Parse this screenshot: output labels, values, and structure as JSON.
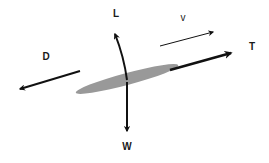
{
  "diagram": {
    "title": "",
    "type": "free-body diagram",
    "colors": {
      "arrow": "#111111",
      "body": "#999999",
      "background": "#ffffff"
    },
    "body": {
      "shape": "ellipse",
      "cx": 127,
      "cy": 79,
      "rx": 53,
      "ry": 6,
      "rotate": -15
    },
    "forces": [
      {
        "id": "lift",
        "label": "L",
        "label_x": 116,
        "label_y": 14,
        "x1": 127,
        "y1": 80,
        "x2": 115,
        "y2": 34,
        "curved": true,
        "width": 2
      },
      {
        "id": "weight",
        "label": "W",
        "label_x": 127,
        "label_y": 147,
        "x1": 127,
        "y1": 82,
        "x2": 127,
        "y2": 131,
        "curved": false,
        "width": 2
      },
      {
        "id": "thrust",
        "label": "T",
        "label_x": 252,
        "label_y": 47,
        "x1": 170,
        "y1": 70,
        "x2": 231,
        "y2": 53,
        "curved": false,
        "width": 2.6
      },
      {
        "id": "drag",
        "label": "D",
        "label_x": 46,
        "label_y": 57,
        "x1": 80,
        "y1": 71,
        "x2": 20,
        "y2": 89,
        "curved": false,
        "width": 2
      },
      {
        "id": "velocity",
        "label": "v",
        "label_x": 183,
        "label_y": 18,
        "x1": 160,
        "y1": 46,
        "x2": 213,
        "y2": 32,
        "curved": false,
        "width": 1
      }
    ]
  }
}
